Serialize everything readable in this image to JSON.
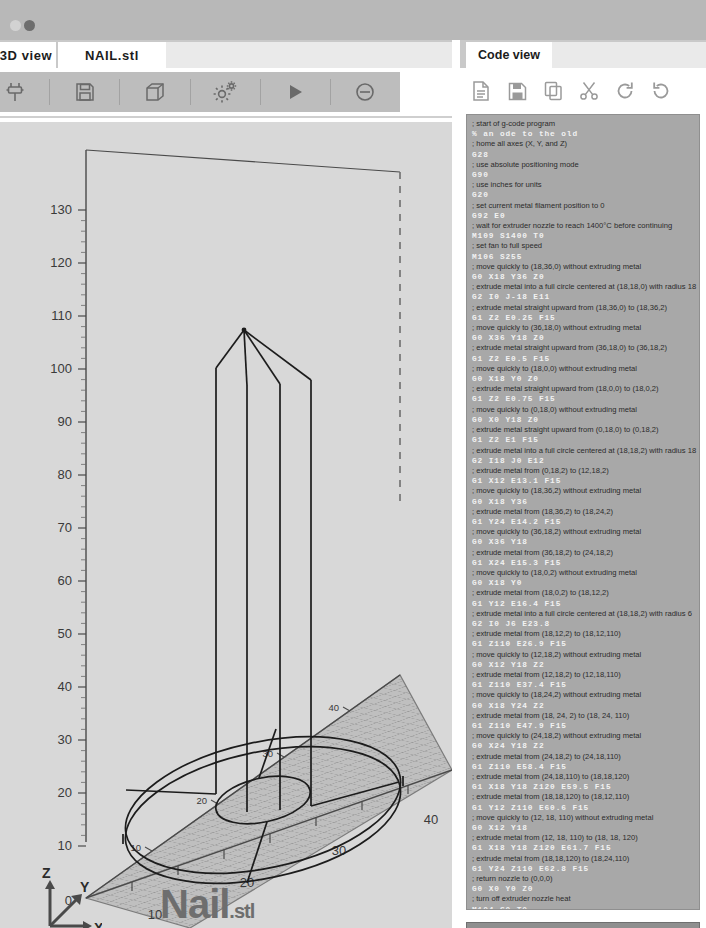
{
  "window": {
    "dots": [
      "inactive-dot",
      "active-dot"
    ]
  },
  "left_panel": {
    "tabs": [
      {
        "label": "3D view",
        "name": "tab-3d-view",
        "active": false
      },
      {
        "label": "NAIL.stl",
        "name": "tab-nail-stl",
        "active": true
      }
    ],
    "toolbar": [
      {
        "icon": "connect-plug-icon",
        "label": "Connect"
      },
      {
        "icon": "save-floppy-icon",
        "label": "Save"
      },
      {
        "icon": "cube-icon",
        "label": "3D Model"
      },
      {
        "icon": "gears-settings-icon",
        "label": "Settings"
      },
      {
        "icon": "play-icon",
        "label": "Run"
      },
      {
        "icon": "stop-disable-icon",
        "label": "Stop"
      }
    ],
    "model_title": "Nail",
    "model_ext": ".stl",
    "axis_indicator": {
      "z": "Z",
      "y": "Y",
      "x": "X"
    }
  },
  "chart_data": {
    "type": "line",
    "title": "Nail.stl",
    "xlabel": "X",
    "ylabel": "Y",
    "zlabel": "Z",
    "xticks": [
      0,
      10,
      20,
      30,
      40
    ],
    "yticks": [
      10,
      20,
      30,
      40
    ],
    "zticks": [
      10,
      20,
      30,
      40,
      50,
      60,
      70,
      80,
      90,
      100,
      110,
      120,
      130
    ],
    "xlim": [
      0,
      40
    ],
    "ylim": [
      0,
      40
    ],
    "zlim": [
      0,
      135
    ],
    "grid": true,
    "legend": null,
    "annotations": [
      "nail head disc at z=2",
      "shaft from z=2 to z=110",
      "tapered point from z=110 to z=120"
    ],
    "geometry": {
      "head_outer_radius": 18,
      "head_inner_radius": 6,
      "head_center": [
        18,
        18
      ],
      "head_height": 2,
      "shaft_radius": 6,
      "shaft_top_z": 110,
      "tip_apex": [
        18,
        18,
        120
      ]
    }
  },
  "right_panel": {
    "tab": {
      "label": "Code view",
      "name": "tab-code-view"
    },
    "toolbar": [
      {
        "icon": "new-file-icon",
        "label": "New"
      },
      {
        "icon": "save-floppy-icon",
        "label": "Save"
      },
      {
        "icon": "copy-icon",
        "label": "Copy"
      },
      {
        "icon": "scissors-cut-icon",
        "label": "Cut"
      },
      {
        "icon": "redo-icon",
        "label": "Redo"
      },
      {
        "icon": "undo-icon",
        "label": "Undo"
      }
    ],
    "generated_button": "Model Generated!",
    "code": [
      {
        "t": "c",
        "v": "; start of g-code program"
      },
      {
        "t": "k",
        "v": "% an ode to the old"
      },
      {
        "t": "c",
        "v": "; home all axes (X, Y, and Z)"
      },
      {
        "t": "k",
        "v": "G28"
      },
      {
        "t": "c",
        "v": "; use absolute positioning mode"
      },
      {
        "t": "k",
        "v": "G90"
      },
      {
        "t": "c",
        "v": "; use inches for units"
      },
      {
        "t": "k",
        "v": "G20"
      },
      {
        "t": "c",
        "v": "; set current metal filament position to 0"
      },
      {
        "t": "k",
        "v": "G92 E0"
      },
      {
        "t": "c",
        "v": "; wait for extruder nozzle to reach 1400°C before continuing"
      },
      {
        "t": "k",
        "v": "M109 S1400 T0"
      },
      {
        "t": "c",
        "v": "; set fan to full speed"
      },
      {
        "t": "k",
        "v": "M106 S255"
      },
      {
        "t": "c",
        "v": "; move quickly to (18,36,0) without extruding metal"
      },
      {
        "t": "k",
        "v": "G0 X18 Y36 Z0"
      },
      {
        "t": "c",
        "v": "; extrude metal into a full circle centered at (18,18,0) with radius 18"
      },
      {
        "t": "k",
        "v": "G2 I0 J-18 E11"
      },
      {
        "t": "c",
        "v": "; extrude metal straight upward from (18,36,0) to (18,36,2)"
      },
      {
        "t": "k",
        "v": "G1 Z2 E0.25 F15"
      },
      {
        "t": "c",
        "v": "; move quickly to (36,18,0) without extruding metal"
      },
      {
        "t": "k",
        "v": "G0 X36 Y18 Z0"
      },
      {
        "t": "c",
        "v": "; extrude metal straight upward from (36,18,0) to (36,18,2)"
      },
      {
        "t": "k",
        "v": "G1 Z2 E0.5 F15"
      },
      {
        "t": "c",
        "v": "; move quickly to (18,0,0) without extruding metal"
      },
      {
        "t": "k",
        "v": "G0 X18 Y0 Z0"
      },
      {
        "t": "c",
        "v": "; extrude metal straight upward from (18,0,0) to (18,0,2)"
      },
      {
        "t": "k",
        "v": "G1 Z2 E0.75 F15"
      },
      {
        "t": "c",
        "v": "; move quickly to (0,18,0) without extruding metal"
      },
      {
        "t": "k",
        "v": "G0 X0 Y18 Z0"
      },
      {
        "t": "c",
        "v": "; extrude metal straight upward from (0,18,0) to (0,18,2)"
      },
      {
        "t": "k",
        "v": "G1 Z2 E1 F15"
      },
      {
        "t": "c",
        "v": "; extrude metal into a full circle centered at (18,18,2) with radius 18"
      },
      {
        "t": "k",
        "v": "G2 I18 J0 E12"
      },
      {
        "t": "c",
        "v": "; extrude metal from (0,18,2) to (12,18,2)"
      },
      {
        "t": "k",
        "v": "G1 X12 E13.1 F15"
      },
      {
        "t": "c",
        "v": "; move quickly to (18,36,2) without extruding metal"
      },
      {
        "t": "k",
        "v": "G0 X18 Y36"
      },
      {
        "t": "c",
        "v": "; extrude metal from (18,36,2) to (18,24,2)"
      },
      {
        "t": "k",
        "v": "G1 Y24 E14.2 F15"
      },
      {
        "t": "c",
        "v": "; move quickly to (36,18,2) without extruding metal"
      },
      {
        "t": "k",
        "v": "G0 X36 Y18"
      },
      {
        "t": "c",
        "v": "; extrude metal from (36,18,2) to (24,18,2)"
      },
      {
        "t": "k",
        "v": "G1 X24 E15.3 F15"
      },
      {
        "t": "c",
        "v": "; move quickly to (18,0,2) without extruding metal"
      },
      {
        "t": "k",
        "v": "G0 X18 Y0"
      },
      {
        "t": "c",
        "v": "; extrude metal from (18,0,2) to (18,12,2)"
      },
      {
        "t": "k",
        "v": "G1 Y12 E16.4 F15"
      },
      {
        "t": "c",
        "v": "; extrude metal into a full circle centered at (18,18,2) with radius 6"
      },
      {
        "t": "k",
        "v": "G2 I0 J6 E23.8"
      },
      {
        "t": "c",
        "v": "; extrude metal from (18,12,2) to (18,12,110)"
      },
      {
        "t": "k",
        "v": "G1 Z110 E26.9 F15"
      },
      {
        "t": "c",
        "v": "; move quickly to (12,18,2) without extruding metal"
      },
      {
        "t": "k",
        "v": "G0 X12 Y18 Z2"
      },
      {
        "t": "c",
        "v": "; extrude metal from (12,18,2) to (12,18,110)"
      },
      {
        "t": "k",
        "v": "G1 Z110 E37.4 F15"
      },
      {
        "t": "c",
        "v": "; move quickly to (18,24,2) without extruding metal"
      },
      {
        "t": "k",
        "v": "G0 X18 Y24 Z2"
      },
      {
        "t": "c",
        "v": "; extrude metal from (18, 24, 2) to (18, 24, 110)"
      },
      {
        "t": "k",
        "v": "G1 Z110 E47.9 F15"
      },
      {
        "t": "c",
        "v": "; move quickly to (24,18,2) without extruding metal"
      },
      {
        "t": "k",
        "v": "G0 X24 Y18 Z2"
      },
      {
        "t": "c",
        "v": "; extrude metal from (24,18,2) to (24,18,110)"
      },
      {
        "t": "k",
        "v": "G1 Z110 E58.4 F15"
      },
      {
        "t": "c",
        "v": "; extrude metal from (24,18,110) to (18,18,120)"
      },
      {
        "t": "k",
        "v": "G1 X18 Y18 Z120 E59.5 F15"
      },
      {
        "t": "c",
        "v": "; extrude metal from (18,18,120) to (18,12,110)"
      },
      {
        "t": "k",
        "v": "G1 Y12 Z110 E60.6 F15"
      },
      {
        "t": "c",
        "v": "; move quickly to (12, 18, 110) without extruding metal"
      },
      {
        "t": "k",
        "v": "G0 X12 Y18"
      },
      {
        "t": "c",
        "v": "; extrude metal from (12, 18, 110) to (18, 18, 120)"
      },
      {
        "t": "k",
        "v": "G1 X18 Y18 Z120 E61.7 F15"
      },
      {
        "t": "c",
        "v": "; extrude metal from (18,18,120) to (18,24,110)"
      },
      {
        "t": "k",
        "v": "G1 Y24 Z110 E62.8 F15"
      },
      {
        "t": "c",
        "v": "; return nozzle to (0,0,0)"
      },
      {
        "t": "k",
        "v": "G0 X0 Y0 Z0"
      },
      {
        "t": "c",
        "v": "; turn off extruder nozzle heat"
      },
      {
        "t": "k",
        "v": "M104 S0 T0"
      },
      {
        "t": "c",
        "v": "; turn off fan"
      },
      {
        "t": "k",
        "v": "M106 S0"
      },
      {
        "t": "c",
        "v": "; end of g-code program"
      },
      {
        "t": "k",
        "v": "%"
      }
    ]
  }
}
